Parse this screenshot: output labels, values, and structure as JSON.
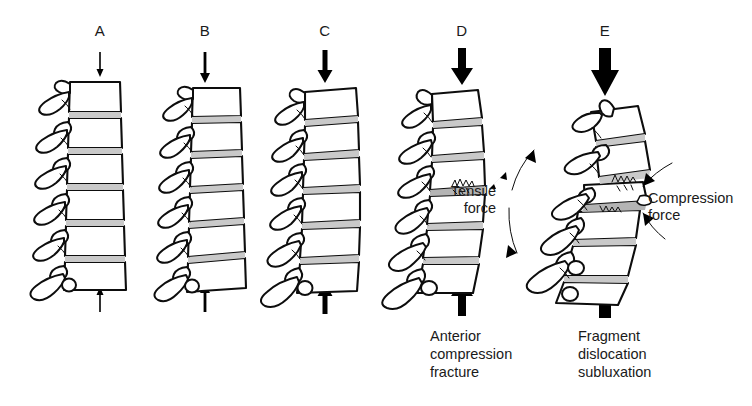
{
  "figure": {
    "type": "medical-illustration",
    "background_color": "#ffffff",
    "ink_color": "#0d0d0d",
    "disc_color": "#c9c9c9"
  },
  "panels": [
    {
      "letter": "A",
      "load": "minimal",
      "arrow_weight": 1,
      "description": "Neutral straight cervical column, axial load applied",
      "caption": ""
    },
    {
      "letter": "B",
      "load": "light",
      "arrow_weight": 2,
      "description": "Slight loss of lordosis under increasing axial load",
      "caption": ""
    },
    {
      "letter": "C",
      "load": "moderate",
      "arrow_weight": 3,
      "description": "Early flexion buckling of the column",
      "caption": ""
    },
    {
      "letter": "D",
      "load": "heavy",
      "arrow_weight": 4,
      "description": "Kyphotic angulation with anterior vertebral body failure",
      "caption": "Anterior\ncompression\nfracture"
    },
    {
      "letter": "E",
      "load": "severe",
      "arrow_weight": 5,
      "description": "Severe angulation with bone fragment displacement and facet subluxation",
      "caption": "Fragment\ndislocation\nsubluxation"
    }
  ],
  "annotations": {
    "tensile": {
      "label": "Tensile\nforce",
      "panel": "E",
      "side": "posterior"
    },
    "compression": {
      "label": "Compression\nforce",
      "panel": "E",
      "side": "anterior"
    }
  }
}
